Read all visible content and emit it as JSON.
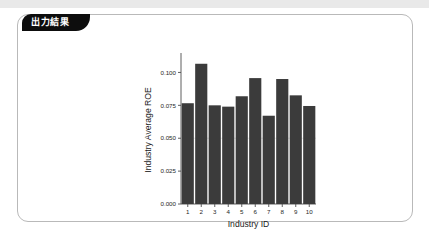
{
  "window": {
    "top_band_color": "#e9e9e9",
    "card_border_color": "#b9b9b9",
    "card_background": "#ffffff"
  },
  "panel": {
    "tab_label": "出力結果",
    "tab_background": "#0d0d0d",
    "tab_text_color": "#ffffff"
  },
  "chart_data": {
    "type": "bar",
    "title": "",
    "xlabel": "Industry ID",
    "ylabel": "Industry Average ROE",
    "categories": [
      "1",
      "2",
      "3",
      "4",
      "5",
      "6",
      "7",
      "8",
      "9",
      "10"
    ],
    "values": [
      0.0766,
      0.1066,
      0.075,
      0.074,
      0.0819,
      0.0957,
      0.0671,
      0.095,
      0.0826,
      0.0745
    ],
    "ylim": [
      0.0,
      0.1125
    ],
    "ytick_labels": [
      "0.000",
      "0.025",
      "0.050",
      "0.075",
      "0.100"
    ],
    "ytick_values": [
      0.0,
      0.025,
      0.05,
      0.075,
      0.1
    ],
    "xtick_labels": [
      "1",
      "2",
      "3",
      "4",
      "5",
      "6",
      "7",
      "8",
      "9",
      "10"
    ],
    "grid": false,
    "legend": "none",
    "bar_color": "#3b3b3b",
    "axis_color": "#4d4d4d",
    "background": "#ffffff"
  }
}
